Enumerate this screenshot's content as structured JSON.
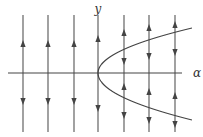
{
  "diagram": {
    "axis_labels": {
      "horizontal": "α",
      "vertical": "y"
    },
    "colors": {
      "line": "#555555",
      "curve": "#444444",
      "arrow": "#444444",
      "background": "#ffffff"
    },
    "axis": {
      "x_y": 73,
      "x_from": 8,
      "x_to": 182,
      "label_x": 197,
      "label_y": 77
    },
    "y_label": {
      "x": 98,
      "y": 13
    },
    "vertical_lines": [
      {
        "x": 23,
        "arrows": [
          {
            "y": 44,
            "dir": "up"
          },
          {
            "y": 101,
            "dir": "down"
          }
        ]
      },
      {
        "x": 48,
        "arrows": [
          {
            "y": 44,
            "dir": "up"
          },
          {
            "y": 101,
            "dir": "down"
          }
        ]
      },
      {
        "x": 74,
        "arrows": [
          {
            "y": 44,
            "dir": "up"
          },
          {
            "y": 101,
            "dir": "down"
          }
        ]
      },
      {
        "x": 98,
        "arrows": [
          {
            "y": 39,
            "dir": "up"
          },
          {
            "y": 108,
            "dir": "down"
          }
        ]
      },
      {
        "x": 124,
        "arrows": [
          {
            "y": 33,
            "dir": "up"
          },
          {
            "y": 61,
            "dir": "down"
          },
          {
            "y": 87,
            "dir": "up"
          },
          {
            "y": 115,
            "dir": "down"
          }
        ]
      },
      {
        "x": 149,
        "arrows": [
          {
            "y": 28,
            "dir": "up"
          },
          {
            "y": 56,
            "dir": "down"
          },
          {
            "y": 92,
            "dir": "up"
          },
          {
            "y": 120,
            "dir": "down"
          }
        ]
      },
      {
        "x": 175,
        "arrows": [
          {
            "y": 25,
            "dir": "up"
          },
          {
            "y": 52,
            "dir": "down"
          },
          {
            "y": 96,
            "dir": "up"
          },
          {
            "y": 124,
            "dir": "down"
          }
        ]
      }
    ],
    "line_range": {
      "top": 15,
      "bottom": 132
    },
    "parabola": {
      "vertex_x": 98,
      "vertex_y": 73,
      "end_x": 192,
      "upper_end_y": 28,
      "lower_end_y": 120
    }
  }
}
